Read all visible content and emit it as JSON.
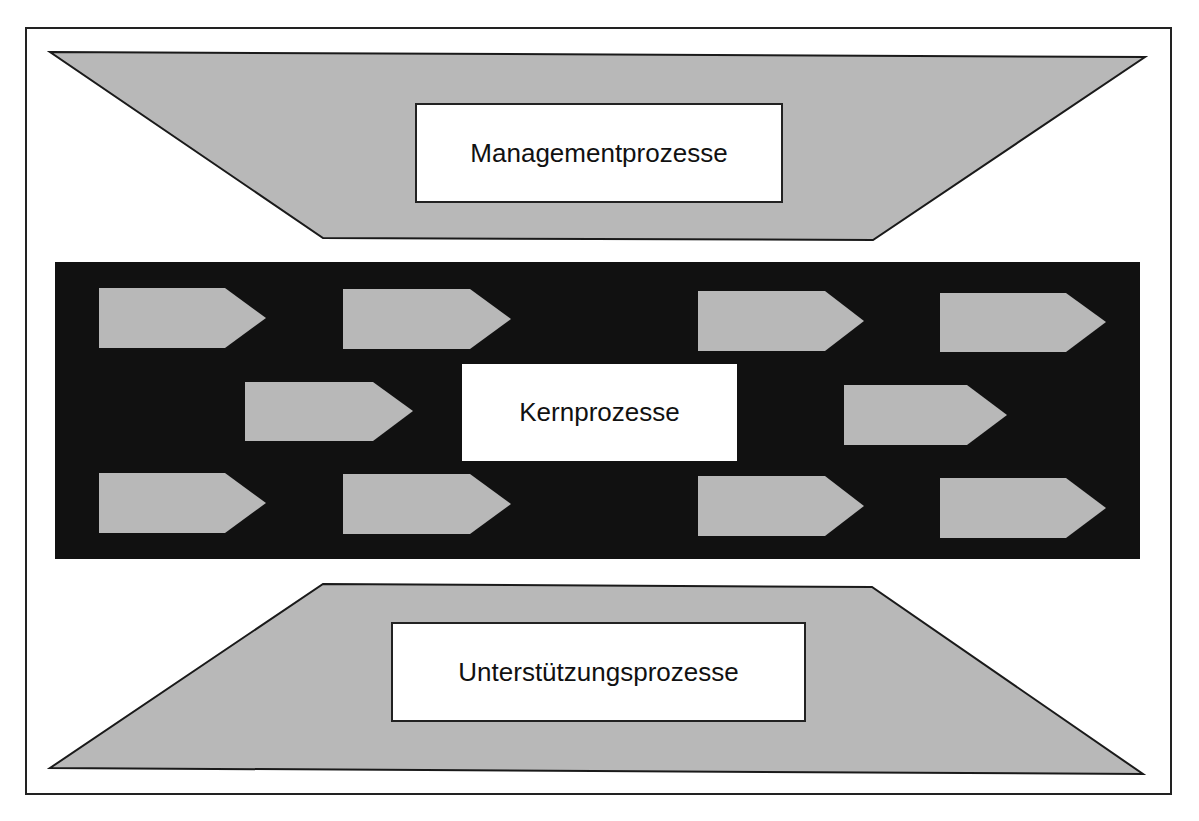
{
  "diagram": {
    "type": "process-map",
    "colors": {
      "background": "#ffffff",
      "frame": "#222222",
      "trapezoid_fill": "#b8b8b8",
      "core_band": "#111111",
      "arrow_fill": "#b8b8b8",
      "label_box": "#ffffff",
      "text": "#111111"
    },
    "management": {
      "label": "Managementprozesse",
      "shape": "inverted-trapezoid"
    },
    "core": {
      "label": "Kernprozesse",
      "shape": "black-band",
      "arrow_count": 10,
      "arrows": [
        {
          "row": 1,
          "col": 1
        },
        {
          "row": 1,
          "col": 2
        },
        {
          "row": 1,
          "col": 3
        },
        {
          "row": 1,
          "col": 4
        },
        {
          "row": 2,
          "col": 1
        },
        {
          "row": 2,
          "col": 2
        },
        {
          "row": 3,
          "col": 1
        },
        {
          "row": 3,
          "col": 2
        },
        {
          "row": 3,
          "col": 3
        },
        {
          "row": 3,
          "col": 4
        }
      ]
    },
    "support": {
      "label": "Unterstützungsprozesse",
      "shape": "trapezoid"
    }
  }
}
